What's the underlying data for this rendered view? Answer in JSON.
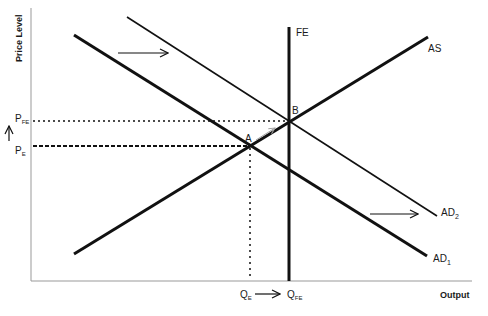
{
  "diagram": {
    "axes": {
      "y_label": "Price Level",
      "x_label": "Output",
      "color": "#999999"
    },
    "curves": {
      "fe": {
        "label": "FE"
      },
      "as": {
        "label": "AS"
      },
      "ad1": {
        "label": "AD",
        "sub": "1"
      },
      "ad2": {
        "label": "AD",
        "sub": "2"
      }
    },
    "points": {
      "a": {
        "label": "A"
      },
      "b": {
        "label": "B"
      }
    },
    "price_labels": {
      "pfe": {
        "label": "P",
        "sub": "FE"
      },
      "pe": {
        "label": "P",
        "sub": "E"
      }
    },
    "quantity_labels": {
      "qe": {
        "label": "Q",
        "sub": "E"
      },
      "qfe": {
        "label": "Q",
        "sub": "FE"
      }
    },
    "colors": {
      "line": "#111111",
      "shift_arrow": "#a0a0a0"
    }
  }
}
